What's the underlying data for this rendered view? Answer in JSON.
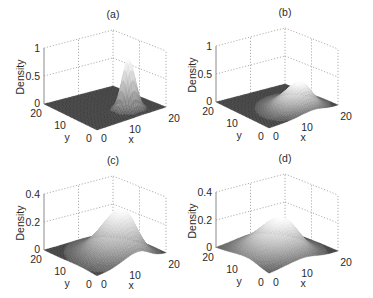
{
  "figure": {
    "panels": [
      {
        "id": "a",
        "title": "(a)",
        "zlabel": "Density",
        "xlabel": "x",
        "ylabel": "y",
        "zticks": [
          "0",
          "0.5",
          "1"
        ],
        "xticks": [
          "0",
          "10",
          "20"
        ],
        "yticks": [
          "0",
          "10",
          "20"
        ]
      },
      {
        "id": "b",
        "title": "(b)",
        "zlabel": "Density",
        "xlabel": "x",
        "ylabel": "y",
        "zticks": [
          "0",
          "0.5",
          "1"
        ],
        "xticks": [
          "0",
          "10",
          "20"
        ],
        "yticks": [
          "0",
          "10",
          "20"
        ]
      },
      {
        "id": "c",
        "title": "(c)",
        "zlabel": "Density",
        "xlabel": "x",
        "ylabel": "y",
        "zticks": [
          "0",
          "0.2",
          "0.4"
        ],
        "xticks": [
          "0",
          "10",
          "20"
        ],
        "yticks": [
          "0",
          "10",
          "20"
        ]
      },
      {
        "id": "d",
        "title": "(d)",
        "zlabel": "Density",
        "xlabel": "x",
        "ylabel": "y",
        "zticks": [
          "0",
          "0.2",
          "0.4"
        ],
        "xticks": [
          "0",
          "10",
          "20"
        ],
        "yticks": [
          "0",
          "10",
          "20"
        ]
      }
    ]
  },
  "chart_data": [
    {
      "type": "surface",
      "title": "(a)",
      "xlabel": "x",
      "ylabel": "y",
      "zlabel": "Density",
      "xlim": [
        0,
        20
      ],
      "ylim": [
        0,
        20
      ],
      "zlim": [
        0,
        1
      ],
      "grid": true,
      "peak": {
        "x": 13,
        "y": 5,
        "z": 0.9
      },
      "shape": "narrow gaussian",
      "spread": [
        1.5,
        1.5
      ]
    },
    {
      "type": "surface",
      "title": "(b)",
      "xlabel": "x",
      "ylabel": "y",
      "zlabel": "Density",
      "xlim": [
        0,
        20
      ],
      "ylim": [
        0,
        20
      ],
      "zlim": [
        0,
        1
      ],
      "grid": true,
      "peak": {
        "x": 13,
        "y": 5,
        "z": 0.45
      },
      "shape": "skewed gaussian",
      "spread": [
        2.5,
        2.5
      ]
    },
    {
      "type": "surface",
      "title": "(c)",
      "xlabel": "x",
      "ylabel": "y",
      "zlabel": "Density",
      "xlim": [
        0,
        20
      ],
      "ylim": [
        0,
        20
      ],
      "zlim": [
        0,
        0.4
      ],
      "grid": true,
      "peak": {
        "x": 12,
        "y": 6,
        "z": 0.33
      },
      "shape": "skewed broad gaussian",
      "spread": [
        3,
        3.5
      ]
    },
    {
      "type": "surface",
      "title": "(d)",
      "xlabel": "x",
      "ylabel": "y",
      "zlabel": "Density",
      "xlim": [
        0,
        20
      ],
      "ylim": [
        0,
        20
      ],
      "zlim": [
        0,
        0.4
      ],
      "grid": true,
      "peak": {
        "x": 10,
        "y": 8,
        "z": 0.25
      },
      "shape": "broad skewed gaussian",
      "spread": [
        3.5,
        4
      ]
    }
  ]
}
